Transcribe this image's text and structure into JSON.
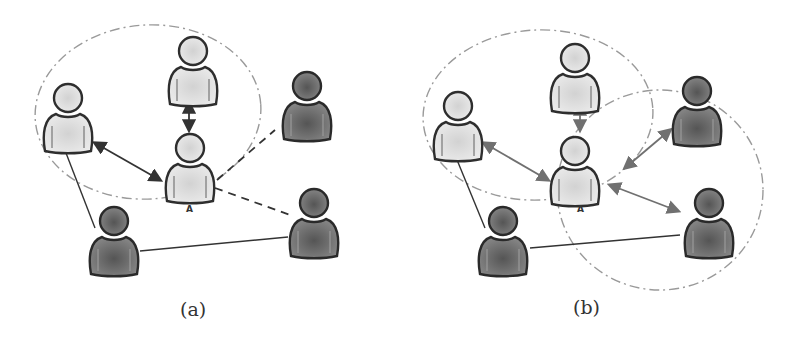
{
  "figure": {
    "panels": [
      {
        "id": "a",
        "caption": "(a)",
        "center_label": "A",
        "people": [
          {
            "id": "left",
            "shade": "light",
            "cx": 68,
            "cy": 95
          },
          {
            "id": "top",
            "shade": "light",
            "cx": 193,
            "cy": 48
          },
          {
            "id": "center_A",
            "shade": "light",
            "cx": 190,
            "cy": 145
          },
          {
            "id": "top_right",
            "shade": "dark",
            "cx": 307,
            "cy": 83
          },
          {
            "id": "bottom_left",
            "shade": "dark",
            "cx": 114,
            "cy": 218
          },
          {
            "id": "bottom_right",
            "shade": "dark",
            "cx": 314,
            "cy": 200
          }
        ],
        "edges": [
          {
            "from": "left",
            "to": "center_A",
            "style": "double-arrow"
          },
          {
            "from": "top",
            "to": "center_A",
            "style": "double-arrow"
          },
          {
            "from": "center_A",
            "to": "top_right",
            "style": "dashed"
          },
          {
            "from": "center_A",
            "to": "bottom_right",
            "style": "dashed"
          },
          {
            "from": "left",
            "to": "bottom_left",
            "style": "solid"
          },
          {
            "from": "bottom_left",
            "to": "bottom_right",
            "style": "solid"
          }
        ],
        "regions": [
          {
            "shape": "ellipse",
            "style": "dash-dot",
            "cx": 148,
            "cy": 112,
            "rx": 113,
            "ry": 87
          }
        ]
      },
      {
        "id": "b",
        "caption": "(b)",
        "center_label": "A",
        "people": [
          {
            "id": "left",
            "shade": "light",
            "cx": 458,
            "cy": 103
          },
          {
            "id": "top",
            "shade": "light",
            "cx": 575,
            "cy": 55
          },
          {
            "id": "center_A",
            "shade": "light",
            "cx": 575,
            "cy": 148
          },
          {
            "id": "top_right",
            "shade": "dark",
            "cx": 697,
            "cy": 88
          },
          {
            "id": "bottom_left",
            "shade": "dark",
            "cx": 503,
            "cy": 218
          },
          {
            "id": "bottom_right",
            "shade": "dark",
            "cx": 709,
            "cy": 200
          }
        ],
        "edges": [
          {
            "from": "left",
            "to": "center_A",
            "style": "double-arrow"
          },
          {
            "from": "top",
            "to": "center_A",
            "style": "double-arrow"
          },
          {
            "from": "center_A",
            "to": "top_right",
            "style": "double-arrow"
          },
          {
            "from": "center_A",
            "to": "bottom_right",
            "style": "double-arrow"
          },
          {
            "from": "left",
            "to": "bottom_left",
            "style": "solid"
          },
          {
            "from": "bottom_left",
            "to": "bottom_right",
            "style": "solid"
          }
        ],
        "regions": [
          {
            "shape": "ellipse",
            "style": "dash-dot",
            "cx": 538,
            "cy": 115,
            "rx": 115,
            "ry": 85
          },
          {
            "shape": "ellipse",
            "style": "dash-dot",
            "cx": 660,
            "cy": 190,
            "rx": 103,
            "ry": 100
          }
        ]
      }
    ],
    "colors": {
      "light_fill": "#e4e4e4",
      "dark_fill": "#6e6e6e",
      "outline": "#2e2e2e",
      "region_stroke": "#9a9a9a",
      "edge_dark": "#333333",
      "edge_grey": "#707070"
    }
  }
}
